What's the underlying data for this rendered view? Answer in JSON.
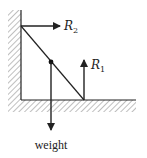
{
  "diagram": {
    "type": "free-body diagram",
    "colors": {
      "line": "#222222",
      "hatch": "#888888",
      "background": "#ffffff"
    },
    "forces": [
      {
        "id": "R2",
        "symbol": "R",
        "subscript": "2",
        "direction": "right",
        "origin": "top of ladder at wall"
      },
      {
        "id": "R1",
        "symbol": "R",
        "subscript": "1",
        "direction": "up",
        "origin": "foot of ladder on floor"
      },
      {
        "id": "weight",
        "label": "weight",
        "direction": "down",
        "origin": "centre of ladder"
      }
    ],
    "labels": {
      "r2_symbol": "R",
      "r2_subscript": "2",
      "r1_symbol": "R",
      "r1_subscript": "1",
      "weight": "weight"
    }
  }
}
